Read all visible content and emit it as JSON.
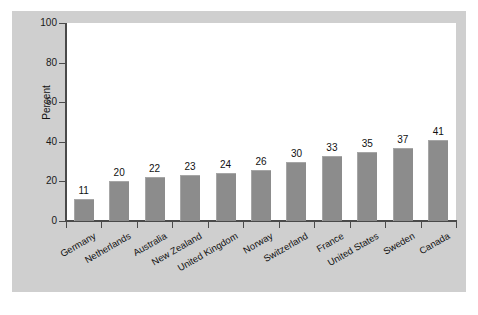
{
  "chart_data": {
    "type": "bar",
    "title": "",
    "subtitle": "",
    "xlabel": "",
    "ylabel": "Percent",
    "ylim": [
      0,
      100
    ],
    "yticks": [
      "0",
      "20",
      "40",
      "60",
      "80",
      "100"
    ],
    "grid": false,
    "legend": false,
    "bar_color": "#8c8c8c",
    "panel_color": "#cfcfcf",
    "plot_background": "#ffffff",
    "axis_color": "#4a4a4a",
    "show_value_labels": true,
    "categories": [
      "Germany",
      "Netherlands",
      "Australia",
      "New Zealand",
      "United Kingdom",
      "Norway",
      "Switzerland",
      "France",
      "United States",
      "Sweden",
      "Canada"
    ],
    "values": [
      11,
      20,
      22,
      23,
      24,
      26,
      30,
      33,
      35,
      37,
      41
    ],
    "value_labels": [
      "11",
      "20",
      "22",
      "23",
      "24",
      "26",
      "30",
      "33",
      "35",
      "37",
      "41"
    ]
  }
}
